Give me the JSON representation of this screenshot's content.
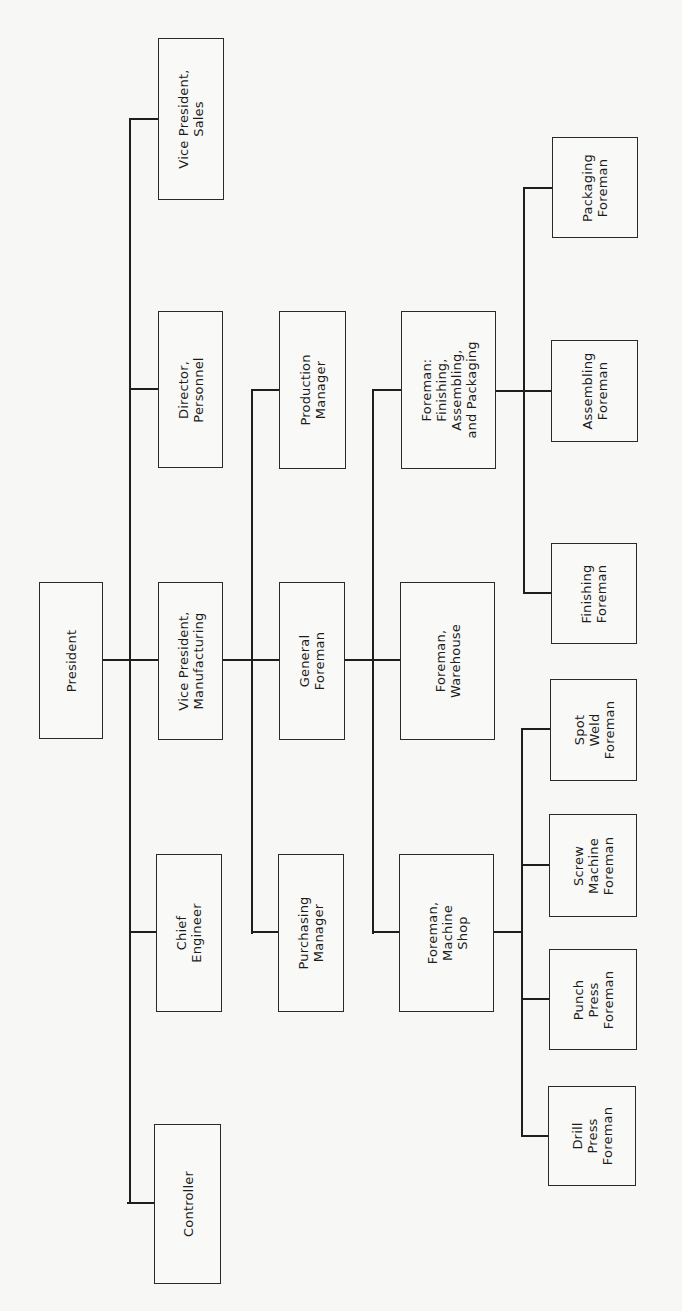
{
  "diagram": {
    "type": "organization-chart",
    "orientation": "rotated-90-ccw",
    "line_color": "#1e1e1e",
    "box_border_color": "#2a2a2a",
    "background": "#f7f7f5"
  },
  "nodes": {
    "president": {
      "label": "President",
      "x": 39,
      "y": 582,
      "w": 64,
      "h": 157
    },
    "vp_sales": {
      "label": "Vice President,\nSales",
      "x": 158,
      "y": 38,
      "w": 66,
      "h": 162
    },
    "director_personnel": {
      "label": "Director,\nPersonnel",
      "x": 158,
      "y": 311,
      "w": 65,
      "h": 157
    },
    "vp_manufacturing": {
      "label": "Vice President,\nManufacturing",
      "x": 158,
      "y": 582,
      "w": 65,
      "h": 158
    },
    "chief_engineer": {
      "label": "Chief\nEngineer",
      "x": 156,
      "y": 854,
      "w": 66,
      "h": 158
    },
    "controller": {
      "label": "Controller",
      "x": 154,
      "y": 1124,
      "w": 67,
      "h": 160
    },
    "production_manager": {
      "label": "Production\nManager",
      "x": 279,
      "y": 311,
      "w": 67,
      "h": 158
    },
    "general_foreman": {
      "label": "General\nForeman",
      "x": 279,
      "y": 582,
      "w": 66,
      "h": 158
    },
    "purchasing_manager": {
      "label": "Purchasing\nManager",
      "x": 278,
      "y": 854,
      "w": 66,
      "h": 158
    },
    "foreman_fap": {
      "label": "Foreman:\nFinishing,\nAssembling,\nand Packaging",
      "x": 401,
      "y": 311,
      "w": 95,
      "h": 158
    },
    "foreman_warehouse": {
      "label": "Foreman,\nWarehouse",
      "x": 400,
      "y": 582,
      "w": 95,
      "h": 158
    },
    "foreman_machine_shop": {
      "label": "Foreman,\nMachine\nShop",
      "x": 399,
      "y": 854,
      "w": 95,
      "h": 158
    },
    "packaging_foreman": {
      "label": "Packaging\nForeman",
      "x": 552,
      "y": 137,
      "w": 86,
      "h": 101
    },
    "assembling_foreman": {
      "label": "Assembling\nForeman",
      "x": 551,
      "y": 340,
      "w": 87,
      "h": 102
    },
    "finishing_foreman": {
      "label": "Finishing\nForeman",
      "x": 551,
      "y": 543,
      "w": 86,
      "h": 101
    },
    "spot_weld_foreman": {
      "label": "Spot\nWeld\nForeman",
      "x": 550,
      "y": 679,
      "w": 87,
      "h": 102
    },
    "screw_machine_foreman": {
      "label": "Screw\nMachine\nForeman",
      "x": 549,
      "y": 814,
      "w": 88,
      "h": 103
    },
    "punch_press_foreman": {
      "label": "Punch\nPress\nForeman",
      "x": 549,
      "y": 949,
      "w": 88,
      "h": 101
    },
    "drill_press_foreman": {
      "label": "Drill\nPress\nForeman",
      "x": 548,
      "y": 1086,
      "w": 88,
      "h": 100
    }
  },
  "edges": [
    {
      "from": "president",
      "to": "vp_sales"
    },
    {
      "from": "president",
      "to": "director_personnel"
    },
    {
      "from": "president",
      "to": "vp_manufacturing"
    },
    {
      "from": "president",
      "to": "chief_engineer"
    },
    {
      "from": "president",
      "to": "controller"
    },
    {
      "from": "vp_manufacturing",
      "to": "production_manager"
    },
    {
      "from": "vp_manufacturing",
      "to": "general_foreman"
    },
    {
      "from": "vp_manufacturing",
      "to": "purchasing_manager"
    },
    {
      "from": "general_foreman",
      "to": "foreman_fap"
    },
    {
      "from": "general_foreman",
      "to": "foreman_warehouse"
    },
    {
      "from": "general_foreman",
      "to": "foreman_machine_shop"
    },
    {
      "from": "foreman_fap",
      "to": "packaging_foreman"
    },
    {
      "from": "foreman_fap",
      "to": "assembling_foreman"
    },
    {
      "from": "foreman_fap",
      "to": "finishing_foreman"
    },
    {
      "from": "foreman_machine_shop",
      "to": "spot_weld_foreman"
    },
    {
      "from": "foreman_machine_shop",
      "to": "screw_machine_foreman"
    },
    {
      "from": "foreman_machine_shop",
      "to": "punch_press_foreman"
    },
    {
      "from": "foreman_machine_shop",
      "to": "drill_press_foreman"
    }
  ]
}
